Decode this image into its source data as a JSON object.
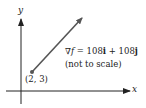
{
  "diagram": {
    "axes": {
      "x_label": "x",
      "y_label": "y"
    },
    "point": {
      "label": "(2, 3)"
    },
    "vector": {
      "nabla": "∇",
      "f": "f",
      "equals": " = 108",
      "i": "i",
      "plus": " + 108",
      "j": "j",
      "note": "(not to scale)"
    },
    "colors": {
      "axis": "#222222",
      "vector": "#555555",
      "point": "#555555"
    }
  }
}
